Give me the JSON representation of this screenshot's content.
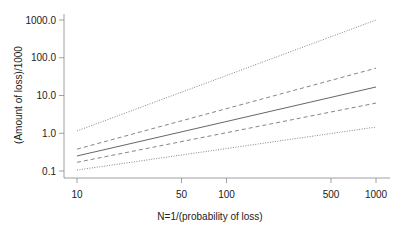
{
  "chart_data": {
    "type": "line",
    "title": "",
    "xlabel": "N=1/(probability of loss)",
    "ylabel": "(Amount of loss)/1000",
    "x_scale": "log",
    "y_scale": "log",
    "xlim": [
      10,
      1000
    ],
    "ylim": [
      0.1,
      1000
    ],
    "x_ticks": [
      "10",
      "50",
      "100",
      "500",
      "1000"
    ],
    "y_ticks": [
      "0.1",
      "1.0",
      "10.0",
      "100.0",
      "1000.0"
    ],
    "grid": false,
    "legend": null,
    "x": [
      10,
      1000
    ],
    "series": [
      {
        "name": "upper dotted bound",
        "style": "dotted",
        "values": [
          1.15,
          1000
        ]
      },
      {
        "name": "upper dashed bound",
        "style": "dashed",
        "values": [
          0.38,
          53
        ]
      },
      {
        "name": "central estimate",
        "style": "solid",
        "values": [
          0.25,
          16.8
        ]
      },
      {
        "name": "lower dashed bound",
        "style": "dashed",
        "values": [
          0.17,
          6.3
        ]
      },
      {
        "name": "lower dotted bound",
        "style": "dotted",
        "values": [
          0.106,
          1.46
        ]
      }
    ]
  }
}
